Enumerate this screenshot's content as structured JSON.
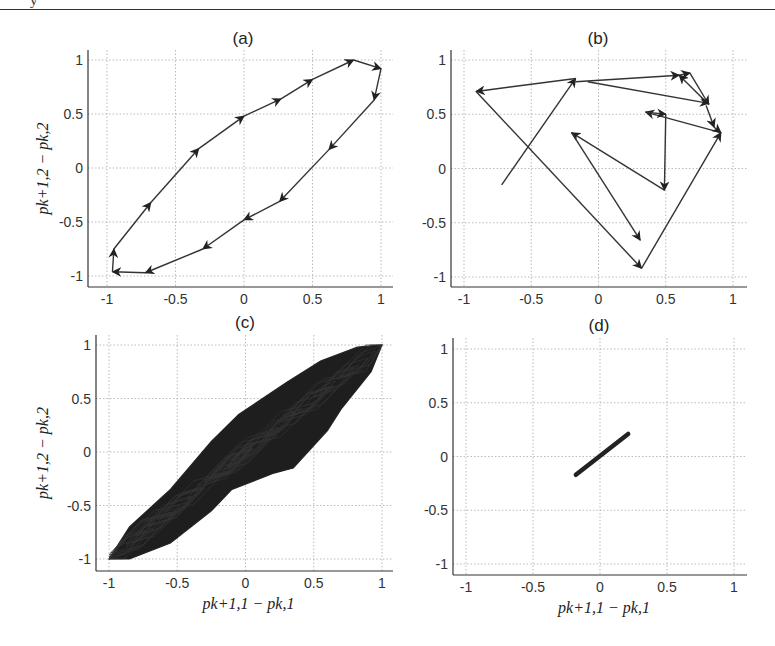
{
  "page": {
    "top_fragment": "y"
  },
  "chart_data": [
    {
      "id": "a",
      "type": "line",
      "title": "(a)",
      "xlabel": "",
      "ylabel": "p_{k+1,2} − p_{k,2}",
      "ylabel_display": "pk+1,2 − pk,2",
      "xlim": [
        -1.05,
        1.05
      ],
      "ylim": [
        -1.05,
        1.05
      ],
      "xticks": [
        -1,
        -0.5,
        0,
        0.5,
        1
      ],
      "yticks": [
        -1,
        -0.5,
        0,
        0.5,
        1
      ],
      "xtick_labels": [
        "-1",
        "-0.5",
        "0",
        "0.5",
        "1"
      ],
      "ytick_labels": [
        "-1",
        "-0.5",
        "0",
        "0.5",
        "1"
      ],
      "grid": true,
      "arrows": true,
      "points": [
        [
          -0.95,
          -0.75
        ],
        [
          -0.68,
          -0.32
        ],
        [
          -0.33,
          0.18
        ],
        [
          0.0,
          0.48
        ],
        [
          0.27,
          0.64
        ],
        [
          0.5,
          0.82
        ],
        [
          0.8,
          1.0
        ],
        [
          1.0,
          0.92
        ],
        [
          0.95,
          0.63
        ],
        [
          0.62,
          0.17
        ],
        [
          0.26,
          -0.31
        ],
        [
          0.0,
          -0.48
        ],
        [
          -0.3,
          -0.75
        ],
        [
          -0.72,
          -0.97
        ],
        [
          -0.96,
          -0.96
        ],
        [
          -0.95,
          -0.75
        ]
      ]
    },
    {
      "id": "b",
      "type": "line",
      "title": "(b)",
      "xlabel": "",
      "ylabel": "",
      "xlim": [
        -1.1,
        1.1
      ],
      "ylim": [
        -1.1,
        1.1
      ],
      "xticks": [
        -1,
        -0.5,
        0,
        0.5,
        1
      ],
      "yticks": [
        -1,
        -0.5,
        0,
        0.5,
        1
      ],
      "xtick_labels": [
        "-1",
        "-0.5",
        "0",
        "0.5",
        "1"
      ],
      "ytick_labels": [
        "-1",
        "-0.5",
        "0",
        "0.5",
        "1"
      ],
      "grid": true,
      "arrows": true,
      "points": [
        [
          -0.72,
          -0.15
        ],
        [
          -0.17,
          0.83
        ],
        [
          -0.91,
          0.71
        ],
        [
          0.32,
          -0.92
        ],
        [
          0.91,
          0.33
        ],
        [
          0.35,
          0.52
        ],
        [
          0.5,
          0.5
        ],
        [
          0.49,
          -0.2
        ],
        [
          -0.2,
          0.33
        ],
        [
          0.31,
          -0.66
        ]
      ],
      "extra_segments": [
        [
          [
            -0.17,
            0.8
          ],
          [
            0.6,
            0.86
          ]
        ],
        [
          [
            0.6,
            0.86
          ],
          [
            0.68,
            0.88
          ]
        ],
        [
          [
            0.68,
            0.88
          ],
          [
            0.82,
            0.59
          ]
        ],
        [
          [
            0.82,
            0.59
          ],
          [
            0.6,
            0.86
          ]
        ],
        [
          [
            -0.08,
            0.8
          ],
          [
            0.82,
            0.6
          ]
        ],
        [
          [
            0.8,
            0.58
          ],
          [
            0.86,
            0.38
          ]
        ],
        [
          [
            0.86,
            0.38
          ],
          [
            0.91,
            0.33
          ]
        ]
      ]
    },
    {
      "id": "c",
      "type": "line",
      "title": "(c)",
      "xlabel": "p_{k+1,1} − p_{k,1}",
      "xlabel_display": "pk+1,1 − pk,1",
      "ylabel": "p_{k+1,2} − p_{k,2}",
      "ylabel_display": "pk+1,2 − pk,2",
      "xlim": [
        -1.08,
        1.03
      ],
      "ylim": [
        -1.1,
        1.05
      ],
      "xticks": [
        -1,
        -0.5,
        0,
        0.5,
        1
      ],
      "yticks": [
        -1,
        -0.5,
        0,
        0.5,
        1
      ],
      "xtick_labels": [
        "-1",
        "-0.5",
        "0",
        "0.5",
        "1"
      ],
      "ytick_labels": [
        "-1",
        "-0.5",
        "0",
        "0.5",
        "1"
      ],
      "grid": true,
      "dense_trajectory": true,
      "envelope": [
        [
          -1.0,
          -1.0
        ],
        [
          -0.85,
          -0.7
        ],
        [
          -0.55,
          -0.35
        ],
        [
          -0.45,
          -0.2
        ],
        [
          -0.25,
          0.1
        ],
        [
          -0.05,
          0.35
        ],
        [
          0.3,
          0.65
        ],
        [
          0.55,
          0.85
        ],
        [
          0.82,
          0.98
        ],
        [
          1.0,
          1.0
        ],
        [
          0.92,
          0.75
        ],
        [
          0.7,
          0.4
        ],
        [
          0.6,
          0.2
        ],
        [
          0.35,
          -0.15
        ],
        [
          0.2,
          -0.2
        ],
        [
          -0.1,
          -0.35
        ],
        [
          -0.25,
          -0.55
        ],
        [
          -0.55,
          -0.85
        ],
        [
          -0.85,
          -1.0
        ],
        [
          -1.0,
          -1.0
        ]
      ]
    },
    {
      "id": "d",
      "type": "line",
      "title": "(d)",
      "xlabel": "p_{k+1,1} − p_{k,1}",
      "xlabel_display": "pk+1,1 − pk,1",
      "ylabel": "",
      "xlim": [
        -1.1,
        1.1
      ],
      "ylim": [
        -1.1,
        1.1
      ],
      "xticks": [
        -1,
        -0.5,
        0,
        0.5,
        1
      ],
      "yticks": [
        -1,
        -0.5,
        0,
        0.5,
        1
      ],
      "xtick_labels": [
        "-1",
        "-0.5",
        "0",
        "0.5",
        "1"
      ],
      "ytick_labels": [
        "-1",
        "-0.5",
        "0",
        "0.5",
        "1"
      ],
      "grid": true,
      "points": [
        [
          -0.18,
          -0.17
        ],
        [
          0.21,
          0.21
        ]
      ]
    }
  ],
  "layout": {
    "panels": {
      "a": {
        "x0": 107,
        "x1": 381,
        "y0": 276,
        "y1": 60,
        "box": [
          88,
          50,
          393,
          287
        ]
      },
      "b": {
        "x0": 464,
        "x1": 733,
        "y0": 277,
        "y1": 60,
        "box": [
          451,
          50,
          747,
          287
        ]
      },
      "c": {
        "x0": 109,
        "x1": 382,
        "y0": 559,
        "y1": 345,
        "box": [
          96,
          335,
          393,
          571
        ]
      },
      "d": {
        "x0": 466,
        "x1": 734,
        "y0": 564,
        "y1": 349,
        "box": [
          453,
          338,
          747,
          575
        ]
      }
    }
  }
}
